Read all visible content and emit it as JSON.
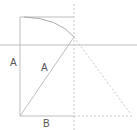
{
  "diagram": {
    "labels": {
      "left_side": "A",
      "hypotenuse": "A",
      "base": "B"
    },
    "colors": {
      "line": "#bdbdbd",
      "dashed": "#c8c8c8",
      "text": "#555555"
    }
  }
}
